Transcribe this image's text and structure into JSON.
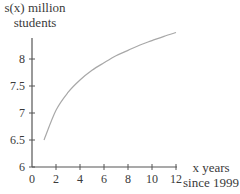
{
  "chart_data": {
    "type": "line",
    "title": "",
    "xlabel": "x years since 1999",
    "ylabel": "s(x) million students",
    "xlim": [
      0,
      12
    ],
    "ylim": [
      6,
      8.5
    ],
    "x_ticks": [
      0,
      2,
      4,
      6,
      8,
      10,
      12
    ],
    "y_ticks": [
      6,
      6.5,
      7,
      7.5,
      8
    ],
    "grid": false,
    "legend": null,
    "series": [
      {
        "name": "s(x)",
        "x": [
          1,
          2,
          3,
          4,
          5,
          6,
          7,
          8,
          9,
          10,
          11,
          12
        ],
        "values": [
          6.5,
          7.05,
          7.38,
          7.61,
          7.79,
          7.93,
          8.06,
          8.16,
          8.26,
          8.34,
          8.42,
          8.49
        ]
      }
    ]
  },
  "labels": {
    "y_axis_line1": "s(x) million",
    "y_axis_line2": "students",
    "x_axis_line1": "x years",
    "x_axis_line2": "since 1999"
  },
  "colors": {
    "axis": "#555555",
    "curve": "#a8a8a8",
    "text": "#3a3a3a"
  }
}
